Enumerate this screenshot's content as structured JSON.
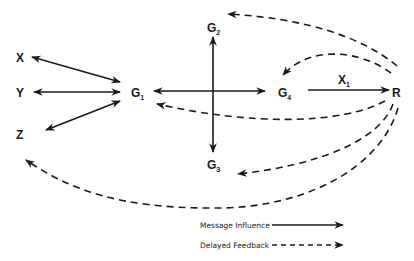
{
  "diagram": {
    "nodes": {
      "x": {
        "label": "X"
      },
      "y": {
        "label": "Y"
      },
      "z": {
        "label": "Z"
      },
      "g1": {
        "label": "G",
        "sub": "1"
      },
      "g2": {
        "label": "G",
        "sub": "2"
      },
      "g3": {
        "label": "G",
        "sub": "3"
      },
      "g4": {
        "label": "G",
        "sub": "4"
      },
      "r": {
        "label": "R"
      }
    },
    "edge_labels": {
      "g4_r": {
        "label": "X",
        "sub": "1"
      }
    },
    "edges": [
      {
        "from": "X",
        "to": "G1",
        "type": "message-influence",
        "bidirectional": true
      },
      {
        "from": "Y",
        "to": "G1",
        "type": "message-influence",
        "bidirectional": true
      },
      {
        "from": "Z",
        "to": "G1",
        "type": "message-influence",
        "bidirectional": true
      },
      {
        "from": "G1",
        "to": "G4",
        "type": "message-influence",
        "bidirectional": true
      },
      {
        "from": "G2",
        "to": "G3",
        "type": "message-influence",
        "bidirectional": true
      },
      {
        "from": "G4",
        "to": "R",
        "type": "message-influence",
        "label": "X1"
      },
      {
        "from": "R",
        "to": "G2",
        "type": "delayed-feedback"
      },
      {
        "from": "R",
        "to": "G4",
        "type": "delayed-feedback"
      },
      {
        "from": "R",
        "to": "G1",
        "type": "delayed-feedback"
      },
      {
        "from": "R",
        "to": "G3",
        "type": "delayed-feedback"
      },
      {
        "from": "R",
        "to": "Z",
        "type": "delayed-feedback"
      }
    ],
    "legend": {
      "message_influence": "Message Influence",
      "delayed_feedback": "Delayed Feedback"
    }
  }
}
